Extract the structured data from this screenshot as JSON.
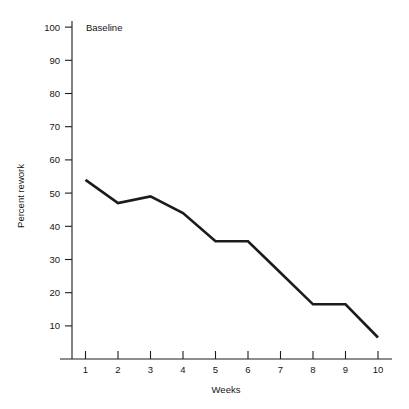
{
  "figure": {
    "background": "#ffffff",
    "line_color": "#1b1b1b",
    "axis_color": "#1c1c1c",
    "text_color": "#151515"
  },
  "annotations": {
    "baseline_label": "Baseline"
  },
  "axes": {
    "y_title": "Percent rework",
    "x_title": "Weeks",
    "y_ticks": [
      "10",
      "20",
      "30",
      "40",
      "50",
      "60",
      "70",
      "80",
      "90",
      "100"
    ],
    "x_ticks": [
      "1",
      "2",
      "3",
      "4",
      "5",
      "6",
      "7",
      "8",
      "9",
      "10"
    ]
  },
  "caption": {
    "cropped_text": ""
  },
  "chart_data": {
    "type": "line",
    "title": "",
    "subtitle": "",
    "xlabel": "Weeks",
    "ylabel": "Percent rework",
    "x": [
      1,
      2,
      3,
      4,
      5,
      6,
      7,
      8,
      9,
      10
    ],
    "categories": [
      "1",
      "2",
      "3",
      "4",
      "5",
      "6",
      "7",
      "8",
      "9",
      "10"
    ],
    "values": [
      54,
      47,
      49,
      44,
      35.5,
      35.5,
      26,
      16.5,
      16.5,
      6.5
    ],
    "series": [
      {
        "name": "Percent rework",
        "values": [
          54,
          47,
          49,
          44,
          35.5,
          35.5,
          26,
          16.5,
          16.5,
          6.5
        ]
      }
    ],
    "xlim": [
      0.5,
      10.5
    ],
    "ylim": [
      0,
      103
    ],
    "ytick_values": [
      10,
      20,
      30,
      40,
      50,
      60,
      70,
      80,
      90,
      100
    ],
    "xtick_values": [
      1,
      2,
      3,
      4,
      5,
      6,
      7,
      8,
      9,
      10
    ],
    "grid": false,
    "legend": "none",
    "markers": false,
    "annotations": [
      {
        "text": "Baseline",
        "x": 1.0,
        "y": 100
      }
    ]
  }
}
